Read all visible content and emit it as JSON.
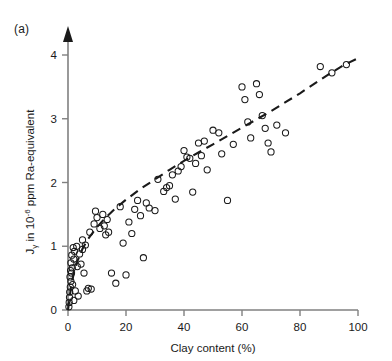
{
  "panel": {
    "label": "(a)"
  },
  "chart_data": {
    "type": "scatter",
    "title": "",
    "subtitle": "",
    "xlabel": "Clay content (%)",
    "ylabel": "Jγ in 10⁻⁶ ppm Ra-equivalent",
    "ylabel_parts": {
      "main_prefix": "J",
      "subscript": "γ",
      "middle": " in 10",
      "superscript": "-6",
      "suffix": " ppm Ra-equivalent"
    },
    "xlim": [
      0,
      100
    ],
    "ylim": [
      0,
      4.4
    ],
    "xticks": [
      0,
      20,
      40,
      60,
      80,
      100
    ],
    "yticks": [
      0,
      1,
      2,
      3,
      4
    ],
    "xtick_labels": [
      "0",
      "20",
      "40",
      "60",
      "80",
      "100"
    ],
    "ytick_labels": [
      "0",
      "1",
      "2",
      "3",
      "4"
    ],
    "grid": false,
    "legend": null,
    "marker": "open-circle",
    "marker_color": "#1a1a1a",
    "axis_color": "#808080",
    "y_axis_arrow": true,
    "series": [
      {
        "name": "samples",
        "points": [
          [
            0.3,
            0.05
          ],
          [
            0.4,
            0.12
          ],
          [
            0.5,
            0.2
          ],
          [
            0.6,
            0.28
          ],
          [
            0.8,
            0.36
          ],
          [
            1.0,
            0.45
          ],
          [
            0.7,
            0.52
          ],
          [
            1.2,
            0.58
          ],
          [
            1.5,
            0.66
          ],
          [
            1.0,
            0.74
          ],
          [
            2.0,
            0.8
          ],
          [
            1.3,
            0.86
          ],
          [
            2.2,
            0.92
          ],
          [
            1.8,
            0.98
          ],
          [
            0.9,
            0.62
          ],
          [
            1.6,
            0.4
          ],
          [
            2.5,
            0.3
          ],
          [
            3.5,
            0.22
          ],
          [
            2.0,
            0.15
          ],
          [
            4.0,
            0.88
          ],
          [
            4.5,
            0.72
          ],
          [
            5.0,
            0.95
          ],
          [
            5.5,
            0.58
          ],
          [
            6.0,
            1.02
          ],
          [
            6.5,
            0.3
          ],
          [
            7.0,
            0.34
          ],
          [
            8.0,
            0.33
          ],
          [
            5.0,
            1.1
          ],
          [
            3.0,
            1.0
          ],
          [
            3.2,
            0.68
          ],
          [
            9.0,
            1.35
          ],
          [
            10.0,
            1.45
          ],
          [
            11.0,
            1.28
          ],
          [
            12.0,
            1.5
          ],
          [
            13.0,
            1.18
          ],
          [
            9.5,
            1.55
          ],
          [
            12.5,
            1.32
          ],
          [
            14.0,
            1.22
          ],
          [
            13.5,
            1.42
          ],
          [
            7.5,
            1.22
          ],
          [
            15.0,
            0.58
          ],
          [
            16.5,
            0.42
          ],
          [
            18.0,
            1.62
          ],
          [
            19.0,
            1.05
          ],
          [
            20.0,
            0.55
          ],
          [
            21.0,
            1.38
          ],
          [
            22.0,
            1.2
          ],
          [
            23.0,
            1.58
          ],
          [
            24.0,
            1.72
          ],
          [
            25.0,
            1.48
          ],
          [
            26.0,
            0.82
          ],
          [
            27.0,
            1.68
          ],
          [
            28.0,
            1.6
          ],
          [
            30.0,
            1.56
          ],
          [
            31.0,
            2.05
          ],
          [
            33.0,
            1.86
          ],
          [
            34.0,
            1.92
          ],
          [
            35.0,
            1.95
          ],
          [
            36.0,
            2.12
          ],
          [
            37.0,
            1.74
          ],
          [
            38.0,
            2.18
          ],
          [
            39.0,
            2.25
          ],
          [
            40.0,
            2.5
          ],
          [
            41.0,
            2.4
          ],
          [
            42.0,
            2.38
          ],
          [
            43.0,
            1.85
          ],
          [
            44.0,
            2.3
          ],
          [
            45.0,
            2.62
          ],
          [
            46.0,
            2.42
          ],
          [
            47.0,
            2.65
          ],
          [
            48.0,
            2.2
          ],
          [
            50.0,
            2.82
          ],
          [
            52.0,
            2.78
          ],
          [
            53.0,
            2.45
          ],
          [
            55.0,
            1.72
          ],
          [
            57.0,
            2.6
          ],
          [
            60.0,
            3.5
          ],
          [
            61.0,
            3.3
          ],
          [
            62.0,
            2.95
          ],
          [
            63.0,
            2.7
          ],
          [
            65.0,
            3.55
          ],
          [
            66.0,
            3.38
          ],
          [
            67.0,
            3.05
          ],
          [
            68.0,
            2.85
          ],
          [
            69.0,
            2.62
          ],
          [
            70.0,
            2.48
          ],
          [
            72.0,
            2.9
          ],
          [
            75.0,
            2.78
          ],
          [
            87.0,
            3.82
          ],
          [
            91.0,
            3.72
          ],
          [
            96.0,
            3.85
          ]
        ]
      }
    ],
    "trend": {
      "name": "fitted-curve",
      "style": "dashed",
      "color": "#1a1a1a",
      "points": [
        [
          0.0,
          0.0
        ],
        [
          1.0,
          0.35
        ],
        [
          2.0,
          0.58
        ],
        [
          3.0,
          0.74
        ],
        [
          5.0,
          0.96
        ],
        [
          7.0,
          1.12
        ],
        [
          10.0,
          1.3
        ],
        [
          13.0,
          1.45
        ],
        [
          16.0,
          1.58
        ],
        [
          20.0,
          1.73
        ],
        [
          25.0,
          1.9
        ],
        [
          30.0,
          2.05
        ],
        [
          35.0,
          2.2
        ],
        [
          40.0,
          2.34
        ],
        [
          45.0,
          2.47
        ],
        [
          50.0,
          2.6
        ],
        [
          55.0,
          2.73
        ],
        [
          60.0,
          2.86
        ],
        [
          65.0,
          2.99
        ],
        [
          70.0,
          3.12
        ],
        [
          75.0,
          3.26
        ],
        [
          80.0,
          3.4
        ],
        [
          85.0,
          3.55
        ],
        [
          90.0,
          3.7
        ],
        [
          95.0,
          3.84
        ],
        [
          100.0,
          3.95
        ]
      ]
    }
  }
}
